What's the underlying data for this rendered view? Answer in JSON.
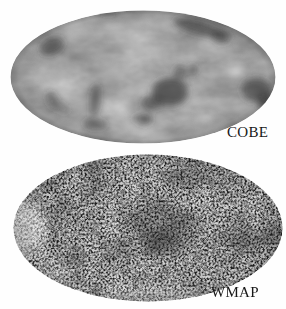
{
  "figure": {
    "description_colors": {
      "page_background": "#fefefe",
      "label_text": "#181818"
    },
    "maps": [
      {
        "id": "cobe",
        "label": "COBE",
        "base_color": "#b7b7b7",
        "dark_feature_color": "#2d2d2d",
        "bright_feature_color": "#e8e8e8",
        "texture": "smooth-low-resolution-blotches"
      },
      {
        "id": "wmap",
        "label": "WMAP",
        "base_color": "#d8d8d8",
        "dark_feature_color": "#1e1e1e",
        "bright_feature_color": "#f2f2f2",
        "texture": "fine-grain-speckle"
      }
    ]
  }
}
